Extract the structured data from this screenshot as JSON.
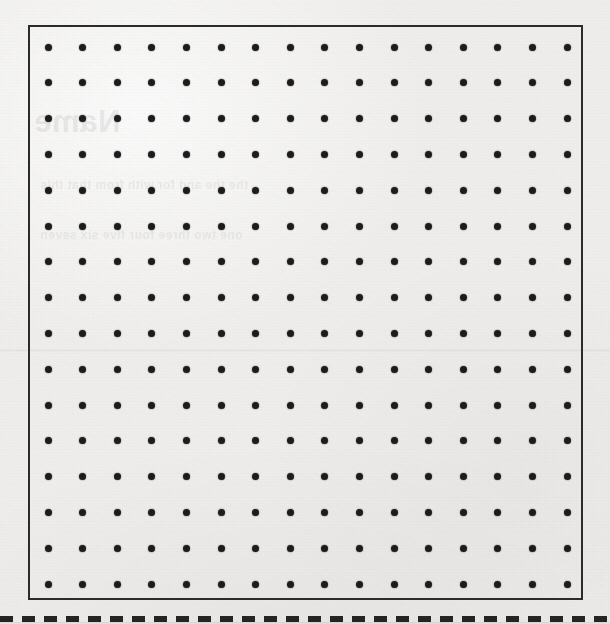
{
  "page": {
    "type": "dot-paper-worksheet",
    "width": 610,
    "height": 624,
    "background_color": "#f1f0ee",
    "ink_color": "#1c1c1c"
  },
  "grid": {
    "label": "16 by 16 dot grid",
    "rows": 16,
    "columns": 16,
    "dot_diameter_px": 7,
    "dot_spacing_x_px": 34.6,
    "dot_spacing_y_px": 35.8,
    "origin_x_px": 18,
    "origin_y_px": 20,
    "dot_color": "#1c1c1c"
  },
  "frame": {
    "name": "grid-border",
    "left_px": 28,
    "top_px": 25,
    "width_px": 555,
    "height_px": 575,
    "border_width_px": 2,
    "border_color": "#2b2b2b"
  },
  "cut_line": {
    "label": "dashed cut line",
    "top_px": 616,
    "dash_length_px": 13,
    "gap_length_px": 9,
    "color": "#242424"
  },
  "crease": {
    "label": "scan crease",
    "top_px": 349
  },
  "bleed_through": {
    "note": "faint mirrored ink showing through from the reverse side of the sheet",
    "heading": "Name",
    "line_a": "the the and for with from that this",
    "line_b": "one two three four five six seven"
  }
}
